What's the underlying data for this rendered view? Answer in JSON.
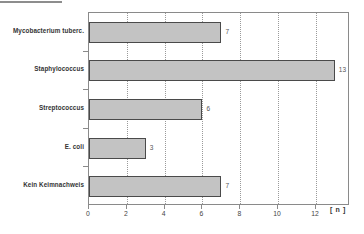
{
  "chart_data": {
    "type": "bar",
    "orientation": "horizontal",
    "title": "",
    "subtitle": "",
    "xlabel": "[ n ]",
    "ylabel": "",
    "categories": [
      "Mycobacterium tuberc.",
      "Staphylococcus",
      "Streptococcus",
      "E. coli",
      "Kein Keimnachweis"
    ],
    "values": [
      7,
      13,
      6,
      3,
      7
    ],
    "data_labels": [
      "7",
      "13",
      "6",
      "3",
      "7"
    ],
    "xlim": [
      0,
      13.8
    ],
    "xticks": [
      0,
      2,
      4,
      6,
      8,
      10,
      12
    ],
    "xtick_labels": [
      "0",
      "2",
      "4",
      "6",
      "8",
      "10",
      "12"
    ],
    "grid": "vertical-dotted",
    "legend": "none",
    "colors": {
      "bar_fill": "#c3c3c3",
      "bar_border": "#4a4a4a",
      "frame": "#8a8a8a",
      "gridline": "#9a9a9a",
      "label_text": "#333333",
      "value_text": "#555555",
      "background": "#ffffff"
    }
  }
}
